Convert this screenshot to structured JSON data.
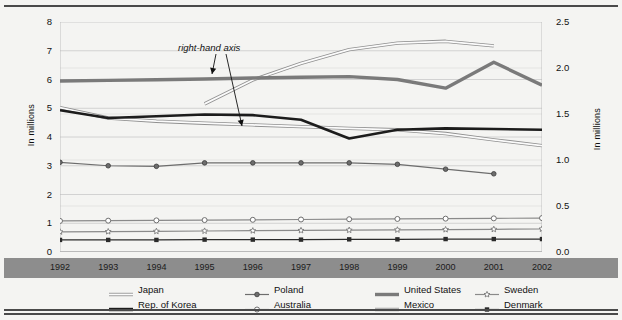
{
  "axes": {
    "left_title": "In millions",
    "right_title": "In millions",
    "left_ticks": [
      "8",
      "7",
      "6",
      "5",
      "4",
      "3",
      "2",
      "1",
      "0"
    ],
    "right_ticks": [
      "2.5",
      "2.0",
      "1.5",
      "1.0",
      "0.5",
      "0.0"
    ]
  },
  "annotation": {
    "text": "right-hand axis"
  },
  "legend": {
    "items": [
      {
        "label": "Japan",
        "color": "#9a9a9a",
        "style": "hollow",
        "marker": "none"
      },
      {
        "label": "Rep. of Korea",
        "color": "#1c1c1c",
        "style": "thick",
        "marker": "none"
      },
      {
        "label": "Poland",
        "color": "#6d6d6d",
        "style": "thin",
        "marker": "circle-filled"
      },
      {
        "label": "Australia",
        "color": "#8a8a8a",
        "style": "thin",
        "marker": "diamond-open"
      },
      {
        "label": "United States",
        "color": "#7a7a7a",
        "style": "thick",
        "marker": "none"
      },
      {
        "label": "Mexico",
        "color": "#a8a8a8",
        "style": "hollow",
        "marker": "none"
      },
      {
        "label": "Sweden",
        "color": "#8a8a8a",
        "style": "thin",
        "marker": "star-open"
      },
      {
        "label": "Denmark",
        "color": "#2b2b2b",
        "style": "thin",
        "marker": "square-filled"
      }
    ]
  },
  "chart_data": {
    "type": "line",
    "title": "",
    "xlabel": "",
    "ylabel": "In millions",
    "y2label": "In millions",
    "x": [
      "1992",
      "1993",
      "1994",
      "1995",
      "1996",
      "1997",
      "1998",
      "1999",
      "2000",
      "2001",
      "2002"
    ],
    "ylim": [
      0,
      8
    ],
    "y2lim": [
      0.0,
      2.5
    ],
    "grid": true,
    "legend_position": "bottom",
    "series": [
      {
        "name": "Japan",
        "axis": "right",
        "color": "#9a9a9a",
        "x": [
          "1995",
          "1996",
          "1997",
          "1998",
          "1999",
          "2000",
          "2001"
        ],
        "values": [
          1.61,
          1.87,
          2.05,
          2.2,
          2.27,
          2.29,
          2.24
        ]
      },
      {
        "name": "United States",
        "axis": "left",
        "color": "#7a7a7a",
        "x": [
          "1992",
          "1993",
          "1994",
          "1995",
          "1996",
          "1997",
          "1998",
          "1999",
          "2000",
          "2001",
          "2002"
        ],
        "values": [
          5.95,
          5.97,
          5.99,
          6.02,
          6.05,
          6.08,
          6.1,
          6.0,
          5.7,
          6.6,
          5.8
        ]
      },
      {
        "name": "Rep. of Korea",
        "axis": "left",
        "color": "#1c1c1c",
        "x": [
          "1992",
          "1993",
          "1994",
          "1995",
          "1996",
          "1997",
          "1998",
          "1999",
          "2000",
          "2001",
          "2002"
        ],
        "values": [
          4.93,
          4.66,
          4.72,
          4.78,
          4.76,
          4.6,
          3.95,
          4.25,
          4.3,
          4.28,
          4.25
        ]
      },
      {
        "name": "Mexico",
        "axis": "left",
        "color": "#a8a8a8",
        "x": [
          "1992",
          "1993",
          "1994",
          "1995",
          "1996",
          "1997",
          "1998",
          "1999",
          "2000",
          "2001",
          "2002"
        ],
        "values": [
          5.02,
          4.66,
          4.55,
          4.48,
          4.42,
          4.36,
          4.3,
          4.25,
          4.12,
          3.9,
          3.7
        ]
      },
      {
        "name": "Poland",
        "axis": "left",
        "color": "#6d6d6d",
        "x": [
          "1992",
          "1993",
          "1994",
          "1995",
          "1996",
          "1997",
          "1998",
          "1999",
          "2000",
          "2001"
        ],
        "values": [
          3.12,
          3.0,
          2.98,
          3.1,
          3.1,
          3.1,
          3.1,
          3.05,
          2.88,
          2.72
        ]
      },
      {
        "name": "Australia",
        "axis": "left",
        "color": "#8a8a8a",
        "x": [
          "1992",
          "1993",
          "1994",
          "1995",
          "1996",
          "1997",
          "1998",
          "1999",
          "2000",
          "2001",
          "2002"
        ],
        "values": [
          1.08,
          1.09,
          1.1,
          1.11,
          1.12,
          1.13,
          1.14,
          1.15,
          1.16,
          1.17,
          1.18
        ]
      },
      {
        "name": "Sweden",
        "axis": "left",
        "color": "#8a8a8a",
        "x": [
          "1992",
          "1993",
          "1994",
          "1995",
          "1996",
          "1997",
          "1998",
          "1999",
          "2000",
          "2001",
          "2002"
        ],
        "values": [
          0.7,
          0.71,
          0.72,
          0.73,
          0.74,
          0.75,
          0.76,
          0.77,
          0.78,
          0.79,
          0.8
        ]
      },
      {
        "name": "Denmark",
        "axis": "left",
        "color": "#2b2b2b",
        "x": [
          "1992",
          "1993",
          "1994",
          "1995",
          "1996",
          "1997",
          "1998",
          "1999",
          "2000",
          "2001",
          "2002"
        ],
        "values": [
          0.42,
          0.42,
          0.42,
          0.43,
          0.43,
          0.43,
          0.44,
          0.44,
          0.45,
          0.45,
          0.45
        ]
      }
    ]
  }
}
